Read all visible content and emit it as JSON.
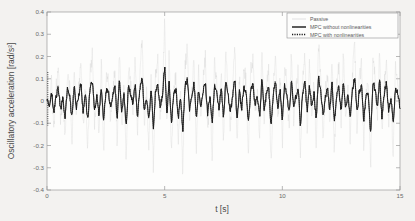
{
  "chart_data": {
    "type": "line",
    "title": "",
    "xlabel": "t [s]",
    "ylabel": "Oscillatory acceleration [rad/s²]",
    "xlim": [
      0,
      15
    ],
    "ylim": [
      -0.4,
      0.4
    ],
    "xticks": [
      "0",
      "5",
      "10",
      "15"
    ],
    "xtick_values": [
      0,
      5,
      10,
      15
    ],
    "yticks": [
      "0.4",
      "0.3",
      "0.2",
      "0.1",
      "0",
      "-0.1",
      "-0.2",
      "-0.3",
      "-0.4"
    ],
    "ytick_values": [
      0.4,
      0.3,
      0.2,
      0.1,
      0,
      -0.1,
      -0.2,
      -0.3,
      -0.4
    ],
    "grid": false,
    "legend_position": "top-right",
    "series": [
      {
        "name": "Passive",
        "style": "thin-line",
        "color": "#cfcfcf",
        "description": "Large-amplitude unattenuated oscillation, peaks near 0.35 and troughs near -0.32",
        "peak_max": 0.35,
        "peak_min": -0.33,
        "rms": 0.11,
        "values": [
          0.02,
          -0.05,
          0.09,
          -0.12,
          0.06,
          0.14,
          -0.09,
          0.03,
          -0.17,
          0.11,
          0.08,
          -0.2,
          0.16,
          -0.06,
          0.05,
          0.19,
          -0.13,
          0.07,
          -0.22,
          0.12,
          0.21,
          -0.1,
          0.04,
          -0.15,
          0.18,
          -0.24,
          0.09,
          0.13,
          -0.07,
          0.02,
          0.17,
          -0.19,
          0.23,
          -0.11,
          0.06,
          -0.26,
          0.14,
          0.08,
          -0.05,
          0.2,
          -0.16,
          0.1,
          0.27,
          -0.09,
          0.03,
          -0.21,
          0.15,
          -0.3,
          0.12,
          0.18,
          -0.07,
          0.05,
          0.35,
          -0.14,
          0.22,
          -0.25,
          0.08,
          0.11,
          -0.18,
          0.06,
          -0.33,
          0.16,
          0.24,
          -0.1,
          0.04,
          0.19,
          -0.23,
          0.13,
          -0.08,
          0.09,
          0.2,
          -0.15,
          0.05,
          -0.27,
          0.17,
          0.1,
          -0.06,
          0.14,
          -0.19,
          0.22,
          0.07,
          -0.12,
          0.03,
          0.26,
          -0.21,
          0.11,
          -0.09,
          0.16,
          0.08,
          -0.24,
          0.13,
          0.19,
          -0.05,
          0.04,
          -0.17,
          0.25,
          -0.13,
          0.09,
          0.15,
          -0.28,
          0.06,
          0.21,
          -0.1,
          0.12,
          -0.2,
          0.18,
          0.07,
          -0.15,
          0.23,
          -0.08,
          0.05,
          0.14,
          -0.26,
          0.1,
          0.2,
          -0.12,
          0.16,
          -0.06,
          0.09,
          -0.22,
          0.27,
          0.11,
          -0.17,
          0.04,
          0.13,
          -0.09,
          0.19,
          -0.24,
          0.08,
          0.15,
          -0.11,
          0.22,
          -0.07,
          0.06,
          -0.19,
          0.12,
          0.25,
          -0.14,
          0.09,
          0.17,
          -0.21,
          0.05,
          0.1,
          -0.3,
          0.18,
          0.13,
          -0.08,
          0.23,
          -0.16,
          0.07,
          0.2,
          -0.11,
          0.04,
          -0.25,
          0.15,
          0.1,
          -0.06
        ]
      },
      {
        "name": "MPC without nonlinearities",
        "style": "solid-line",
        "color": "#262626",
        "description": "Strongly attenuated oscillation, peaks near 0.16 and troughs near -0.16",
        "peak_max": 0.16,
        "peak_min": -0.16,
        "rms": 0.05,
        "values": [
          0.01,
          -0.02,
          0.04,
          -0.05,
          0.02,
          0.06,
          -0.04,
          0.01,
          -0.07,
          0.05,
          0.03,
          -0.08,
          0.07,
          -0.03,
          0.02,
          0.08,
          -0.05,
          0.03,
          -0.09,
          0.05,
          0.09,
          -0.04,
          0.02,
          -0.06,
          0.07,
          -0.1,
          0.04,
          0.05,
          -0.03,
          0.01,
          0.07,
          -0.08,
          0.09,
          -0.05,
          0.03,
          -0.11,
          0.06,
          0.03,
          -0.02,
          0.08,
          -0.07,
          0.04,
          0.11,
          -0.04,
          0.01,
          -0.09,
          0.06,
          -0.12,
          0.05,
          0.07,
          -0.03,
          0.02,
          0.16,
          -0.06,
          0.09,
          -0.1,
          0.03,
          0.05,
          -0.08,
          0.02,
          -0.14,
          0.07,
          0.1,
          -0.04,
          0.02,
          0.08,
          -0.09,
          0.05,
          -0.03,
          0.04,
          0.08,
          -0.06,
          0.02,
          -0.11,
          0.07,
          0.04,
          -0.03,
          0.06,
          -0.08,
          0.09,
          0.03,
          -0.05,
          0.01,
          0.1,
          -0.09,
          0.05,
          -0.04,
          0.07,
          0.03,
          -0.1,
          0.05,
          0.08,
          -0.02,
          0.02,
          -0.07,
          0.1,
          -0.05,
          0.04,
          0.06,
          -0.12,
          0.03,
          0.09,
          -0.04,
          0.05,
          -0.08,
          0.07,
          0.03,
          -0.06,
          0.09,
          -0.03,
          0.02,
          0.06,
          -0.11,
          0.04,
          0.08,
          -0.05,
          0.07,
          -0.03,
          0.04,
          -0.09,
          0.11,
          0.05,
          -0.07,
          0.02,
          0.05,
          -0.04,
          0.08,
          -0.1,
          0.03,
          0.06,
          -0.05,
          0.09,
          -0.03,
          0.02,
          -0.08,
          0.05,
          0.1,
          -0.06,
          0.04,
          0.07,
          -0.09,
          0.02,
          0.04,
          -0.15,
          0.08,
          0.05,
          -0.03,
          0.1,
          -0.07,
          0.03,
          0.08,
          -0.05,
          0.02,
          -0.11,
          0.06,
          0.04,
          -0.03
        ]
      },
      {
        "name": "MPC with nonlinearities",
        "style": "dotted-line",
        "color": "#1a1a1a",
        "description": "Nearly coincident with MPC without nonlinearities, dotted markers, initial transient spike at t=0 spanning +0.13 to -0.11",
        "peak_max": 0.16,
        "peak_min": -0.16,
        "rms": 0.05,
        "initial_transient": [
          0.13,
          -0.11
        ]
      }
    ]
  },
  "legend": {
    "items": [
      {
        "label": "Passive",
        "marker": "thin-line",
        "color": "#cfcfcf"
      },
      {
        "label": "MPC without nonlinearities",
        "marker": "solid-line",
        "color": "#262626"
      },
      {
        "label": "MPC with nonlinearities",
        "marker": "dotted-line",
        "color": "#1a1a1a"
      }
    ]
  }
}
